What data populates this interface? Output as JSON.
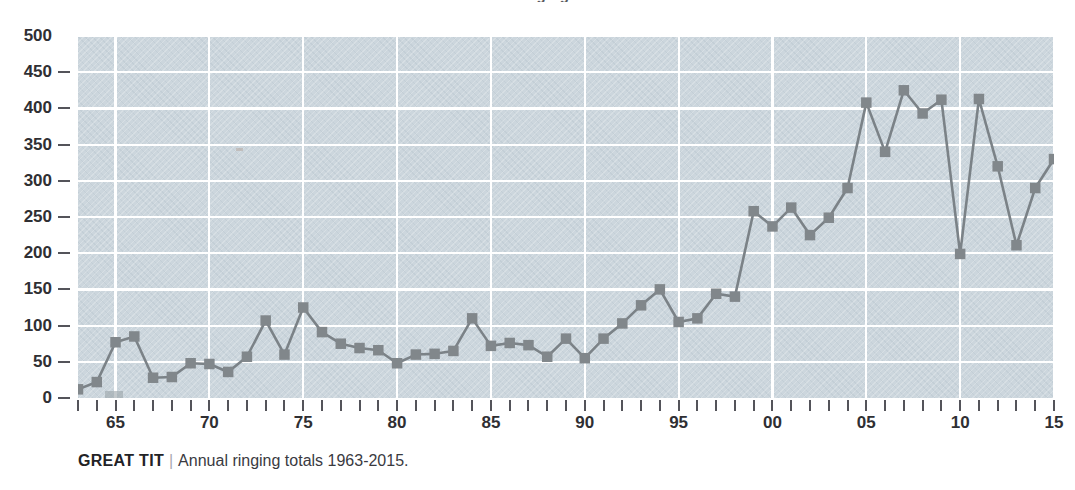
{
  "figure": {
    "title_partial": "Annual ringing totals",
    "caption": {
      "species": "GREAT TIT",
      "separator": "|",
      "text": "Annual ringing totals 1963-2015."
    }
  },
  "colors": {
    "plot_background": "#ccd6dd",
    "gridline": "#ffffff",
    "series_line": "#7b8287",
    "marker": "#81878b",
    "axis_text": "#2f2f33",
    "tick": "#54545a",
    "page_background": "#ffffff"
  },
  "chart_data": {
    "type": "line",
    "title": "Annual ringing totals",
    "xlabel": "",
    "ylabel": "",
    "ylim": [
      0,
      500
    ],
    "xlim": [
      1963,
      2015
    ],
    "y_ticks": [
      0,
      50,
      100,
      150,
      200,
      250,
      300,
      350,
      400,
      450,
      500
    ],
    "y_tick_labels": [
      "0",
      "50",
      "100",
      "150",
      "200",
      "250",
      "300",
      "350",
      "400",
      "450",
      "500"
    ],
    "x_tick_years": [
      1963,
      1964,
      1965,
      1966,
      1967,
      1968,
      1969,
      1970,
      1971,
      1972,
      1973,
      1974,
      1975,
      1976,
      1977,
      1978,
      1979,
      1980,
      1981,
      1982,
      1983,
      1984,
      1985,
      1986,
      1987,
      1988,
      1989,
      1990,
      1991,
      1992,
      1993,
      1994,
      1995,
      1996,
      1997,
      1998,
      1999,
      2000,
      2001,
      2002,
      2003,
      2004,
      2005,
      2006,
      2007,
      2008,
      2009,
      2010,
      2011,
      2012,
      2013,
      2014,
      2015
    ],
    "x_labeled_ticks": [
      {
        "year": 1965,
        "label": "65"
      },
      {
        "year": 1970,
        "label": "70"
      },
      {
        "year": 1975,
        "label": "75"
      },
      {
        "year": 1980,
        "label": "80"
      },
      {
        "year": 1985,
        "label": "85"
      },
      {
        "year": 1990,
        "label": "90"
      },
      {
        "year": 1995,
        "label": "95"
      },
      {
        "year": 2000,
        "label": "00"
      },
      {
        "year": 2005,
        "label": "05"
      },
      {
        "year": 2010,
        "label": "10"
      },
      {
        "year": 2015,
        "label": "15"
      }
    ],
    "grid": {
      "x": true,
      "y": true,
      "x_every": 5,
      "y_every": 50
    },
    "legend": null,
    "markers": "square",
    "categories": [
      1963,
      1964,
      1965,
      1966,
      1967,
      1968,
      1969,
      1970,
      1971,
      1972,
      1973,
      1974,
      1975,
      1976,
      1977,
      1978,
      1979,
      1980,
      1981,
      1982,
      1983,
      1984,
      1985,
      1986,
      1987,
      1988,
      1989,
      1990,
      1991,
      1992,
      1993,
      1994,
      1995,
      1996,
      1997,
      1998,
      1999,
      2000,
      2001,
      2002,
      2003,
      2004,
      2005,
      2006,
      2007,
      2008,
      2009,
      2010,
      2011,
      2012,
      2013,
      2014,
      2015
    ],
    "values": [
      12,
      22,
      77,
      85,
      28,
      29,
      48,
      47,
      36,
      57,
      107,
      60,
      125,
      91,
      75,
      69,
      66,
      48,
      60,
      61,
      65,
      110,
      72,
      76,
      73,
      57,
      82,
      55,
      82,
      103,
      128,
      150,
      105,
      110,
      144,
      140,
      258,
      237,
      263,
      225,
      249,
      290,
      408,
      340,
      425,
      393,
      412,
      199,
      413,
      320,
      211,
      290,
      330
    ],
    "series": [
      {
        "name": "Great Tit annual ringing total",
        "values": [
          12,
          22,
          77,
          85,
          28,
          29,
          48,
          47,
          36,
          57,
          107,
          60,
          125,
          91,
          75,
          69,
          66,
          48,
          60,
          61,
          65,
          110,
          72,
          76,
          73,
          57,
          82,
          55,
          82,
          103,
          128,
          150,
          105,
          110,
          144,
          140,
          258,
          237,
          263,
          225,
          249,
          290,
          408,
          340,
          425,
          393,
          412,
          199,
          413,
          320,
          211,
          290,
          330
        ]
      }
    ]
  }
}
